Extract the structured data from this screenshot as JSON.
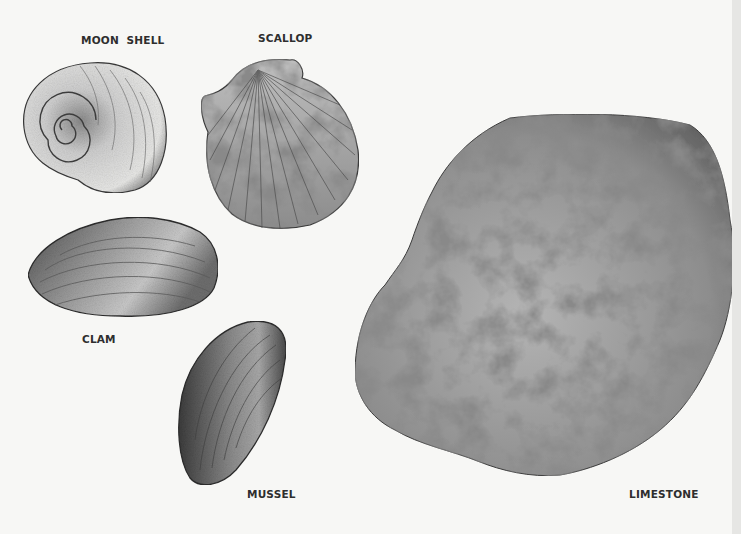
{
  "illustration": {
    "title": "Shells and Limestone",
    "specimens": [
      {
        "id": "moon-shell",
        "label": "MOON  SHELL"
      },
      {
        "id": "scallop",
        "label": "SCALLOP"
      },
      {
        "id": "clam",
        "label": "CLAM"
      },
      {
        "id": "mussel",
        "label": "MUSSEL"
      },
      {
        "id": "limestone",
        "label": "LIMESTONE"
      }
    ],
    "colors": {
      "paper": "#f7f7f5",
      "ink": "#2e2e2e",
      "graphite_dark": "#4a4a4a",
      "graphite_mid": "#8a8a8a",
      "graphite_light": "#d6d6d6"
    }
  }
}
